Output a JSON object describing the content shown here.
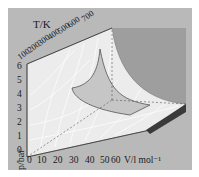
{
  "figure": {
    "type": "3d-surface",
    "axes": {
      "temperature": {
        "label": "T/K",
        "ticks": [
          "100",
          "200",
          "300",
          "400",
          "500",
          "600",
          "700"
        ]
      },
      "pressure": {
        "label": "p/bar",
        "ticks": [
          "0",
          "1",
          "2",
          "3",
          "4",
          "5",
          "6"
        ]
      },
      "volume": {
        "label": "V/l mol⁻¹",
        "ticks": [
          "0",
          "10",
          "20",
          "30",
          "40",
          "50",
          "60"
        ]
      }
    },
    "colors": {
      "background_panel": "#b9b9b9",
      "surface": "#ececec",
      "surface_grid": "#ffffff",
      "highlight_region": "#c6c6c6",
      "back_wall": "#9c9c9c",
      "shadow_edge": "#3a3a3a"
    }
  }
}
